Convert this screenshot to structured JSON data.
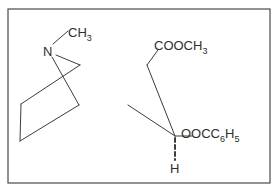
{
  "diagram": {
    "type": "chemical-structure",
    "frame": {
      "x": 8,
      "y": 9,
      "width": 262,
      "height": 174,
      "stroke": "#4a4a4a"
    },
    "bond_color": "#3c3c3c",
    "accent_tint": "#7fd39a",
    "labels": {
      "nitrogen": "N",
      "n_methyl": {
        "main": "CH",
        "sub": "3"
      },
      "ester_top": {
        "main": "COOCH",
        "sub": "3"
      },
      "ester_bottom": {
        "main": "OOCC",
        "sub1": "6",
        "mid": "H",
        "sub2": "5"
      },
      "hydrogen": "H"
    }
  }
}
